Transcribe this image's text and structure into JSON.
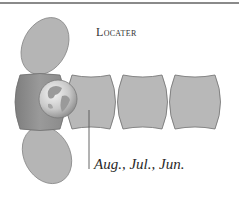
{
  "title": "Locater",
  "label": "Aug., Jul., Jun.",
  "colors": {
    "panel_fill": "#b8b8b8",
    "panel_dark_fill": "#8f8f8f",
    "panel_stroke": "#6f6f6f",
    "ellipse_fill": "#b5b5b5",
    "leader_line": "#555555",
    "rule": "#8a8a8a"
  },
  "diagram": {
    "panels": [
      {
        "id": "panel-1",
        "highlight": "dark"
      },
      {
        "id": "panel-2",
        "highlight": "none"
      },
      {
        "id": "panel-3",
        "highlight": "none"
      },
      {
        "id": "panel-4",
        "highlight": "none"
      }
    ],
    "flaps": [
      "top-ellipse",
      "bottom-ellipse"
    ],
    "icon": "globe-icon"
  }
}
